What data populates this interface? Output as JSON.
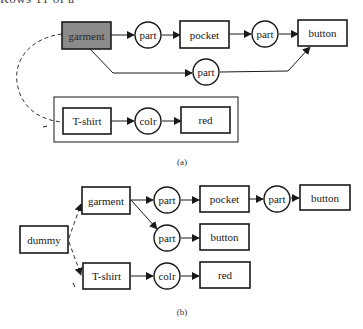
{
  "header_fragment": "Rows 11 of a",
  "diagram_a": {
    "caption": "(a)",
    "nodes": {
      "garment": "garment",
      "part1": "part",
      "pocket": "pocket",
      "part2": "part",
      "button": "button",
      "part3": "part",
      "tshirt": "T-shirt",
      "colr": "colr",
      "red": "red"
    }
  },
  "diagram_b": {
    "caption": "(b)",
    "nodes": {
      "dummy": "dummy",
      "garment": "garment",
      "part1": "part",
      "pocket": "pocket",
      "part2": "part",
      "button1": "button",
      "part3": "part",
      "button2": "button",
      "tshirt": "T-shirt",
      "colr": "colr",
      "red": "red"
    }
  },
  "colors": {
    "stroke": "#1a1a1a",
    "shaded_fill": "#8a8a8a",
    "background": "#ffffff"
  }
}
